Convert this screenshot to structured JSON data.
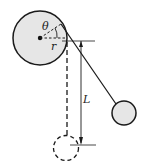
{
  "diagram": {
    "type": "physics-pendulum-wrapping-cylinder",
    "labels": {
      "theta": "θ",
      "radius": "r",
      "length": "L"
    },
    "colors": {
      "stroke": "#1a1a1a",
      "fill": "#e6e6e6",
      "background": "#ffffff"
    }
  }
}
